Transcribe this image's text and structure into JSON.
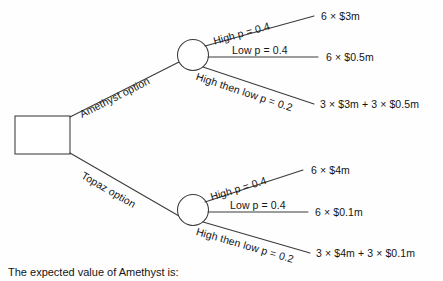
{
  "diagram": {
    "type": "decision-tree",
    "title_caption": "The expected value of Amethyst is:",
    "decision_node": {
      "shape": "square",
      "label": ""
    },
    "branches": [
      {
        "id": "amethyst",
        "label": "Amethyst option",
        "chance_node": "circle",
        "outcomes": [
          {
            "label": "High p = 0.4",
            "probability": "0.4",
            "state": "High",
            "payoff": "6 × $3m"
          },
          {
            "label": "Low p = 0.4",
            "probability": "0.4",
            "state": "Low",
            "payoff": "6 × $0.5m"
          },
          {
            "label": "High then low p = 0.2",
            "probability": "0.2",
            "state": "High then low",
            "payoff": "3 × $3m + 3 × $0.5m"
          }
        ]
      },
      {
        "id": "topaz",
        "label": "Topaz option",
        "chance_node": "circle",
        "outcomes": [
          {
            "label": "High p = 0.4",
            "probability": "0.4",
            "state": "High",
            "payoff": "6 × $4m"
          },
          {
            "label": "Low p = 0.4",
            "probability": "0.4",
            "state": "Low",
            "payoff": "6 × $0.1m"
          },
          {
            "label": "High then low p = 0.2",
            "probability": "0.2",
            "state": "High then low",
            "payoff": "3 × $4m + 3 × $0.1m"
          }
        ]
      }
    ],
    "colors": {
      "line": "#3a3a3a",
      "text": "#141414",
      "background": "#fefefe"
    }
  }
}
